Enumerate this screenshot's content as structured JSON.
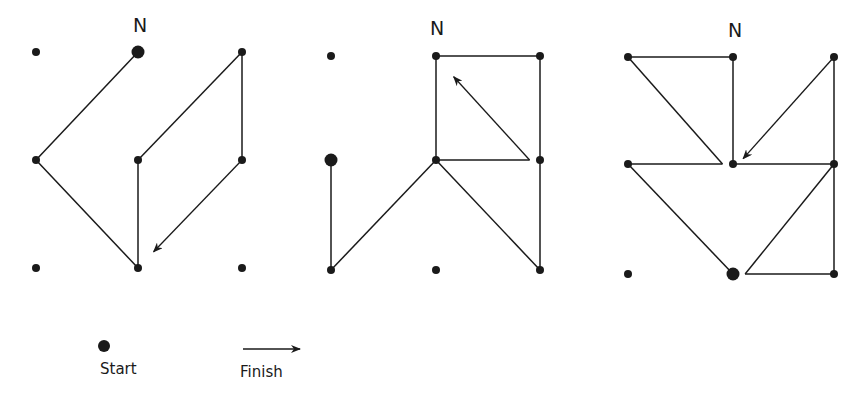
{
  "colors": {
    "ink": "#1a1a1a",
    "background": "#ffffff"
  },
  "north_label": "N",
  "legend": {
    "start_label": "Start",
    "finish_label": "Finish"
  },
  "diagrams": [
    {
      "id": "diagram-1",
      "grid": "3x3",
      "start": [
        1,
        0
      ],
      "path": [
        [
          1,
          0
        ],
        [
          0,
          1
        ],
        [
          1,
          2
        ],
        [
          1,
          1
        ],
        [
          2,
          0
        ],
        [
          2,
          1
        ]
      ],
      "finish_toward": [
        1.15,
        1.85
      ]
    },
    {
      "id": "diagram-2",
      "grid": "3x3",
      "start": [
        0,
        1
      ],
      "path": [
        [
          0,
          1
        ],
        [
          0,
          2
        ],
        [
          1,
          1
        ],
        [
          2,
          2
        ],
        [
          2,
          1
        ],
        [
          2,
          0
        ],
        [
          1,
          0
        ],
        [
          1,
          1
        ],
        [
          1.9,
          1
        ]
      ],
      "finish_toward": [
        1.17,
        0.2
      ]
    },
    {
      "id": "diagram-3",
      "grid": "3x3",
      "start": [
        1,
        2
      ],
      "path": [
        [
          1,
          2
        ],
        [
          0,
          1
        ],
        [
          0.9,
          1
        ],
        [
          0,
          0
        ],
        [
          1,
          0
        ],
        [
          1,
          1
        ],
        [
          2,
          1
        ],
        [
          1.12,
          2
        ],
        [
          2,
          2
        ],
        [
          2,
          1
        ],
        [
          2,
          0
        ]
      ],
      "finish_toward": [
        1.1,
        0.95
      ]
    }
  ]
}
